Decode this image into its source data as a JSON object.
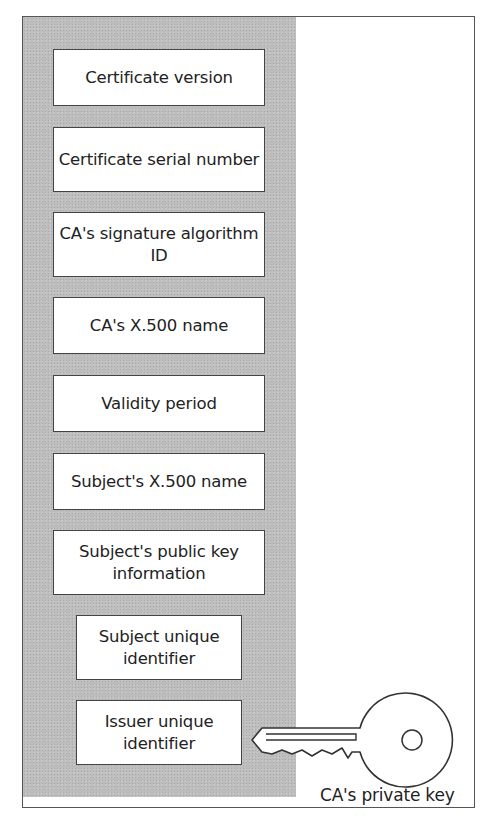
{
  "diagram": {
    "fields": [
      {
        "label": "Certificate version",
        "x": 53,
        "y": 49,
        "w": 212,
        "h": 57
      },
      {
        "label": "Certificate serial number",
        "x": 53,
        "y": 127,
        "w": 212,
        "h": 65
      },
      {
        "label": "CA's signature algorithm ID",
        "x": 53,
        "y": 212,
        "w": 212,
        "h": 65
      },
      {
        "label": "CA's X.500 name",
        "x": 53,
        "y": 297,
        "w": 212,
        "h": 57
      },
      {
        "label": "Validity period",
        "x": 53,
        "y": 375,
        "w": 212,
        "h": 57
      },
      {
        "label": "Subject's X.500 name",
        "x": 53,
        "y": 453,
        "w": 212,
        "h": 57
      },
      {
        "label": "Subject's public key information",
        "x": 53,
        "y": 530,
        "w": 212,
        "h": 65
      },
      {
        "label": "Subject unique identifier",
        "x": 76,
        "y": 615,
        "w": 166,
        "h": 65
      },
      {
        "label": "Issuer unique identifier",
        "x": 76,
        "y": 700,
        "w": 166,
        "h": 65
      }
    ],
    "key": {
      "label": "CA's private key",
      "icon": "key-icon"
    },
    "colors": {
      "panel": "#bdbdbd",
      "border": "#444444",
      "box": "#ffffff",
      "text": "#222222"
    }
  }
}
